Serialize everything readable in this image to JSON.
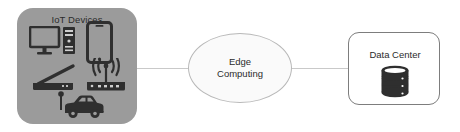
{
  "diagram": {
    "nodes": {
      "iot": {
        "label": "IoT Devices",
        "fill_color": "#9b9b9b",
        "text_color": "#2b2b2b",
        "icons": [
          {
            "name": "desktop-computer-icon",
            "label": "Desktop computer with tower"
          },
          {
            "name": "smartphone-icon",
            "label": "Smartphone"
          },
          {
            "name": "router-antenna-icon",
            "label": "Router with antenna"
          },
          {
            "name": "wifi-router-icon",
            "label": "Wireless router broadcasting signal"
          },
          {
            "name": "connected-car-icon",
            "label": "Connected car with antenna"
          }
        ]
      },
      "edge": {
        "label": "Edge\nComputing",
        "shape": "ellipse",
        "fill_color": "#fafafa",
        "border_color": "#b8b8b8",
        "text_color": "#2b2b2b"
      },
      "datacenter": {
        "label": "Data Center",
        "shape": "rounded-rectangle",
        "fill_color": "#ffffff",
        "border_color": "#7d7d7d",
        "text_color": "#2b2b2b",
        "icon": {
          "name": "database-icon",
          "label": "Database cylinder stack"
        }
      }
    },
    "connectors": [
      {
        "name": "iot-to-edge-connector",
        "from": "iot",
        "to": "edge",
        "color": "#c9c9c9",
        "style": "solid-line"
      },
      {
        "name": "edge-to-datacenter-connector",
        "from": "edge",
        "to": "datacenter",
        "color": "#c9c9c9",
        "style": "solid-line"
      }
    ]
  }
}
